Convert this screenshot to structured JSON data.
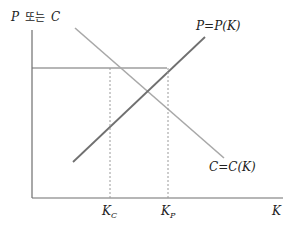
{
  "diagram": {
    "y_axis_label_var": "P",
    "y_axis_label_conj": "또는",
    "y_axis_label_var2": "C",
    "x_axis_label": "K",
    "curve_p_label": "P=P(K)",
    "curve_c_label": "C=C(K)",
    "tick_kc_main": "K",
    "tick_kc_sub": "C",
    "tick_kp_main": "K",
    "tick_kp_sub": "P",
    "colors": {
      "axis": "#6e6e6e",
      "curve_p": "#707070",
      "curve_c": "#a8a8a8",
      "horizontal_line": "#6e6e6e",
      "dashed": "#9a9a9a",
      "text": "#222222"
    }
  }
}
